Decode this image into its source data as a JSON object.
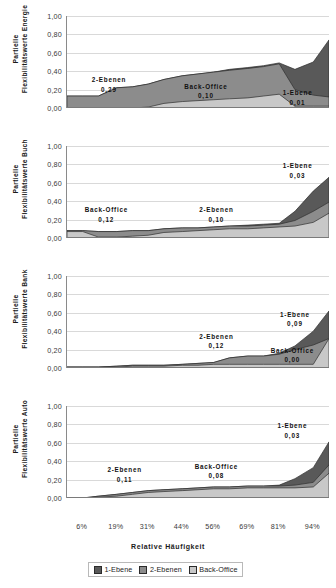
{
  "chart_data": {
    "type": "area",
    "title": "",
    "xlabel": "Relative Häufigkeit",
    "ylim": [
      0,
      1
    ],
    "ytick_labels": [
      "0,00",
      "0,20",
      "0,40",
      "0,60",
      "0,80",
      "1,00"
    ],
    "ytick_values": [
      0,
      0.2,
      0.4,
      0.6,
      0.8,
      1.0
    ],
    "xtick_labels": [
      "6%",
      "19%",
      "31%",
      "44%",
      "56%",
      "69%",
      "81%",
      "94%"
    ],
    "xtick_values": [
      6,
      19,
      31,
      44,
      56,
      69,
      81,
      94
    ],
    "grid": true,
    "stacked": true,
    "legend_position": "bottom",
    "series_names": [
      "1-Ebene",
      "2-Ebenen",
      "Back-Office"
    ],
    "colors": {
      "1-Ebene": "#595959",
      "2-Ebenen": "#8c8c8c",
      "Back-Office": "#c8c8c8",
      "gridline": "#d9d9d9",
      "axis": "#7a7a7a"
    },
    "x": [
      0,
      6,
      12,
      19,
      25,
      31,
      37,
      44,
      50,
      56,
      62,
      69,
      75,
      81,
      87,
      94,
      100
    ],
    "panels": [
      {
        "name": "Energie",
        "ylabel_line1": "Partielle",
        "ylabel_line2": "Flexibilitätswerte Energie",
        "series": [
          {
            "name": "Back-Office",
            "values": [
              0.0,
              0.0,
              0.0,
              0.0,
              0.0,
              0.01,
              0.05,
              0.07,
              0.08,
              0.09,
              0.1,
              0.11,
              0.13,
              0.15,
              0.02,
              0.02,
              0.02
            ]
          },
          {
            "name": "2-Ebenen",
            "values": [
              0.13,
              0.13,
              0.13,
              0.22,
              0.23,
              0.25,
              0.26,
              0.28,
              0.29,
              0.3,
              0.31,
              0.32,
              0.32,
              0.33,
              0.18,
              0.12,
              0.1
            ]
          },
          {
            "name": "1-Ebene",
            "values": [
              0.0,
              0.0,
              0.0,
              0.0,
              0.0,
              0.0,
              0.0,
              0.0,
              0.0,
              0.0,
              0.01,
              0.01,
              0.01,
              0.01,
              0.22,
              0.36,
              0.62
            ]
          }
        ],
        "annotations": [
          {
            "label": "2-Ebenen",
            "value": "0,29",
            "x": 16,
            "y": 0.3
          },
          {
            "label": "Back-Office",
            "value": "0,10",
            "x": 53,
            "y": 0.23
          },
          {
            "label": "1-Ebene",
            "value": "0,01",
            "x": 88,
            "y": 0.16
          }
        ]
      },
      {
        "name": "Buch",
        "ylabel_line1": "Partielle",
        "ylabel_line2": "Flexibilitätswerte Buch",
        "series": [
          {
            "name": "Back-Office",
            "values": [
              0.07,
              0.07,
              0.01,
              0.01,
              0.02,
              0.03,
              0.06,
              0.07,
              0.08,
              0.09,
              0.1,
              0.1,
              0.11,
              0.12,
              0.13,
              0.17,
              0.27
            ]
          },
          {
            "name": "2-Ebenen",
            "values": [
              0.01,
              0.01,
              0.06,
              0.06,
              0.06,
              0.05,
              0.04,
              0.04,
              0.03,
              0.03,
              0.03,
              0.03,
              0.03,
              0.03,
              0.06,
              0.12,
              0.12
            ]
          },
          {
            "name": "1-Ebene",
            "values": [
              0.0,
              0.0,
              0.0,
              0.0,
              0.0,
              0.0,
              0.0,
              0.0,
              0.0,
              0.0,
              0.0,
              0.01,
              0.01,
              0.01,
              0.1,
              0.22,
              0.27
            ]
          }
        ],
        "annotations": [
          {
            "label": "Back-Office",
            "value": "0,12",
            "x": 15,
            "y": 0.3
          },
          {
            "label": "2-Ebenen",
            "value": "0,10",
            "x": 57,
            "y": 0.3
          },
          {
            "label": "1-Ebene",
            "value": "0,03",
            "x": 88,
            "y": 0.78
          }
        ]
      },
      {
        "name": "Bank",
        "ylabel_line1": "Partielle",
        "ylabel_line2": "Flexibilitätswerte Bank",
        "series": [
          {
            "name": "Back-Office",
            "values": [
              0.01,
              0.01,
              0.01,
              0.01,
              0.02,
              0.02,
              0.02,
              0.03,
              0.03,
              0.04,
              0.04,
              0.04,
              0.04,
              0.04,
              0.04,
              0.04,
              0.32
            ]
          },
          {
            "name": "2-Ebenen",
            "values": [
              0.0,
              0.0,
              0.0,
              0.01,
              0.01,
              0.01,
              0.01,
              0.01,
              0.02,
              0.02,
              0.07,
              0.09,
              0.09,
              0.11,
              0.16,
              0.21,
              0.0
            ]
          },
          {
            "name": "1-Ebene",
            "values": [
              0.0,
              0.0,
              0.0,
              0.0,
              0.0,
              0.0,
              0.0,
              0.0,
              0.0,
              0.0,
              0.0,
              0.0,
              0.0,
              0.01,
              0.04,
              0.15,
              0.3
            ]
          }
        ],
        "annotations": [
          {
            "label": "2-Ebenen",
            "value": "0,12",
            "x": 57,
            "y": 0.34
          },
          {
            "label": "Back-Office",
            "value": "0,00",
            "x": 86,
            "y": 0.19
          },
          {
            "label": "1-Ebene",
            "value": "0,09",
            "x": 87,
            "y": 0.58
          }
        ]
      },
      {
        "name": "Auto",
        "ylabel_line1": "Partielle",
        "ylabel_line2": "Flexibilitätswerte Auto",
        "series": [
          {
            "name": "Back-Office",
            "values": [
              0.0,
              0.0,
              0.01,
              0.02,
              0.04,
              0.06,
              0.07,
              0.08,
              0.09,
              0.1,
              0.1,
              0.11,
              0.11,
              0.11,
              0.11,
              0.12,
              0.27
            ]
          },
          {
            "name": "2-Ebenen",
            "values": [
              0.0,
              0.0,
              0.01,
              0.02,
              0.02,
              0.02,
              0.02,
              0.02,
              0.02,
              0.02,
              0.02,
              0.02,
              0.02,
              0.02,
              0.03,
              0.05,
              0.09
            ]
          },
          {
            "name": "1-Ebene",
            "values": [
              0.0,
              0.0,
              0.0,
              0.0,
              0.0,
              0.0,
              0.0,
              0.0,
              0.0,
              0.0,
              0.0,
              0.0,
              0.0,
              0.01,
              0.07,
              0.16,
              0.25
            ]
          }
        ],
        "annotations": [
          {
            "label": "2-Ebenen",
            "value": "0,11",
            "x": 22,
            "y": 0.3
          },
          {
            "label": "Back-Office",
            "value": "0,08",
            "x": 57,
            "y": 0.34
          },
          {
            "label": "1-Ebene",
            "value": "0,03",
            "x": 86,
            "y": 0.78
          }
        ]
      }
    ]
  }
}
